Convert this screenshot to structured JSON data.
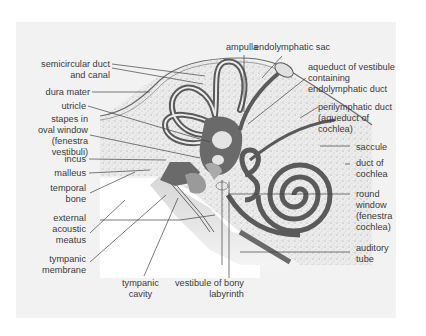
{
  "figure": {
    "colors": {
      "background": "#ffffff",
      "card": "#f2f2f2",
      "duct": "#5a5a5a",
      "bone_speckle": "#e8e8e8",
      "cavity": "#cfcfcf",
      "text": "#3a3a3a"
    }
  },
  "labels": {
    "left": {
      "semicircular_1": "semicircular duct",
      "semicircular_2": "and canal",
      "dura_mater": "dura mater",
      "utricle": "utricle",
      "stapes_1": "stapes in",
      "stapes_2": "oval window",
      "stapes_3": "(fenestra",
      "stapes_4": "vestibuli)",
      "incus": "incus",
      "malleus": "malleus",
      "temporal_1": "temporal",
      "temporal_2": "bone",
      "external_1": "external",
      "external_2": "acoustic",
      "external_3": "meatus",
      "tympanic_m_1": "tympanic",
      "tympanic_m_2": "membrane"
    },
    "top": {
      "ampulla": "ampulla",
      "endolymphatic_sac": "endolymphatic sac"
    },
    "right": {
      "aqueduct_1": "aqueduct of vestibule",
      "aqueduct_2": "containing",
      "aqueduct_3": "endolymphatic duct",
      "perilymphatic_1": "perilymphatic duct",
      "perilymphatic_2": "(aqueduct of",
      "perilymphatic_3": "cochlea)",
      "saccule": "saccule",
      "duct_cochlea_1": "duct of",
      "duct_cochlea_2": "cochlea",
      "round_1": "round",
      "round_2": "window",
      "round_3": "(fenestra",
      "round_4": "cochlea)",
      "auditory_1": "auditory",
      "auditory_2": "tube"
    },
    "bottom": {
      "tympanic_cavity_1": "tympanic",
      "tympanic_cavity_2": "cavity",
      "vestibule_1": "vestibule of bony",
      "vestibule_2": "labyrinth"
    }
  }
}
